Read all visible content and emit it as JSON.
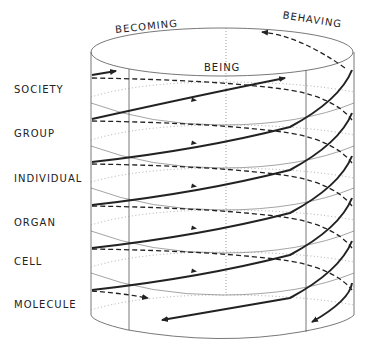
{
  "top_labels": {
    "becoming": "BECOMING",
    "being": "BEING",
    "behaving": "BEHAVING"
  },
  "levels": [
    {
      "label": "SOCIETY",
      "y": 89
    },
    {
      "label": "GROUP",
      "y": 133
    },
    {
      "label": "INDIVIDUAL",
      "y": 178
    },
    {
      "label": "ORGAN",
      "y": 222
    },
    {
      "label": "CELL",
      "y": 262
    },
    {
      "label": "MOLECULE",
      "y": 305
    }
  ],
  "colors": {
    "ink": "#222222",
    "thin": "#555555",
    "dotted": "#888888",
    "background": "#ffffff"
  }
}
